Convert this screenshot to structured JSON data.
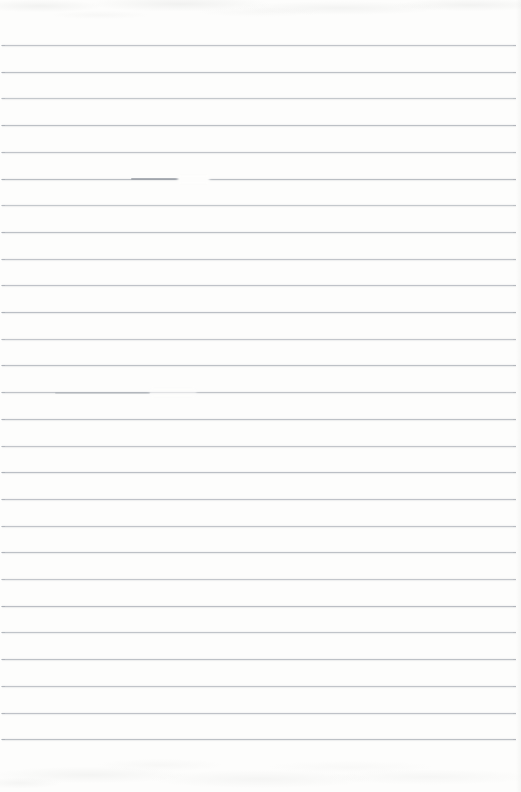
{
  "page": {
    "type": "scanned blank ruled notebook page",
    "width_px": 521,
    "height_px": 792,
    "visible_text": ""
  },
  "colors": {
    "paper": "#fdfdfc",
    "ruled_line": "#b7bbc1",
    "ruled_line_dark": "#9aa0a7",
    "scan_noise": "#e3e4e2"
  },
  "ruling": {
    "line_count": 27,
    "first_line_y_px": 45,
    "line_spacing_px": 26.7,
    "line_left_inset_px": 2,
    "line_right_inset_px": 5,
    "line_opacities": [
      0.85,
      0.9,
      0.8,
      0.92,
      0.85,
      0.95,
      0.8,
      0.9,
      0.85,
      0.88,
      0.93,
      0.82,
      0.9,
      0.87,
      0.9,
      0.84,
      0.93,
      0.88,
      0.85,
      0.9,
      0.82,
      0.94,
      0.86,
      0.9,
      0.85,
      0.88,
      0.92
    ]
  },
  "artifacts": [
    {
      "name": "ink-blotch-with-white-gap",
      "line_index": 5,
      "dark_x1": 131,
      "dark_x2": 180,
      "dark_opacity": 0.8,
      "gap_x1": 178,
      "gap_x2": 209,
      "gap_opacity": 1
    },
    {
      "name": "faded-smudge",
      "line_index": 13,
      "dark_x1": 55,
      "dark_x2": 150,
      "dark_opacity": 0.35,
      "gap_x1": 150,
      "gap_x2": 196,
      "gap_opacity": 0.55
    }
  ]
}
